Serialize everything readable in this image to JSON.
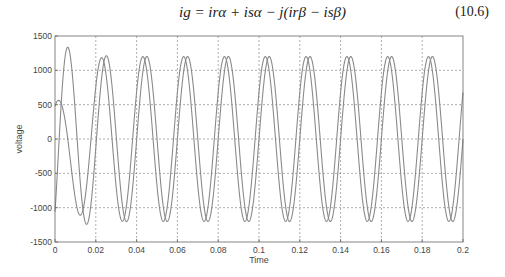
{
  "equation": {
    "text": "ig = irα + isα − j(irβ − isβ)",
    "number": "(10.6)"
  },
  "chart_data": {
    "type": "line",
    "title": "",
    "xlabel": "Time",
    "ylabel": "voltage",
    "xlim": [
      0,
      0.2
    ],
    "ylim": [
      -1500,
      1500
    ],
    "grid": true,
    "legend": null,
    "xticks": [
      0,
      0.02,
      0.04,
      0.06,
      0.08,
      0.1,
      0.12,
      0.14,
      0.16,
      0.18,
      0.2
    ],
    "xtick_labels": [
      "0",
      "0.02",
      "0.04",
      "0.06",
      "0.08",
      "0.1",
      "0.12",
      "0.14",
      "0.16",
      "0.18",
      "0.2"
    ],
    "yticks": [
      1500,
      1000,
      500,
      0,
      -500,
      -1000,
      -1500
    ],
    "ytick_labels": [
      "1500",
      "1000",
      "500",
      "0",
      "-500",
      "-1000",
      "-1500"
    ],
    "series": [
      {
        "name": "signal-1",
        "frequency_hz": 50,
        "steady_amplitude": 1200,
        "phase_deg": 0,
        "transient_peaks": [
          {
            "x": 0.007,
            "y": 1490
          },
          {
            "x": 0.012,
            "y": -1390
          },
          {
            "x": 0.022,
            "y": 1050
          }
        ],
        "color": "#8a8a8a"
      },
      {
        "name": "signal-2",
        "frequency_hz": 50,
        "steady_amplitude": 1200,
        "phase_deg": -90,
        "transient_peaks": [
          {
            "x": 0.002,
            "y": 500
          },
          {
            "x": 0.017,
            "y": -1150
          },
          {
            "x": 0.027,
            "y": 1190
          }
        ],
        "color": "#8a8a8a"
      }
    ]
  },
  "layout": {
    "plot_left": 55,
    "plot_right": 463,
    "plot_top": 36,
    "plot_bottom": 242
  }
}
